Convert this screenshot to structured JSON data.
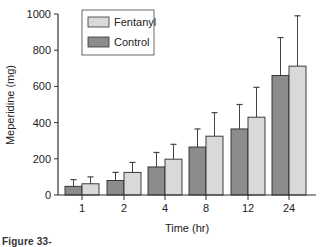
{
  "chart_data": {
    "type": "bar",
    "title": "",
    "xlabel": "Time (hr)",
    "ylabel": "Meperidine (mg)",
    "ylim": [
      0,
      1000
    ],
    "yticks": [
      0,
      200,
      400,
      600,
      800,
      1000
    ],
    "categories": [
      "1",
      "2",
      "4",
      "8",
      "12",
      "24"
    ],
    "grid": false,
    "legend_position": "upper-left",
    "error_bars": true,
    "series": [
      {
        "name": "Control",
        "color": "#8c8c8c",
        "values": [
          48,
          80,
          155,
          265,
          365,
          660
        ],
        "error_upper": [
          85,
          125,
          235,
          365,
          500,
          870
        ]
      },
      {
        "name": "Fentanyl",
        "color": "#d9d9d9",
        "values": [
          62,
          125,
          198,
          325,
          430,
          712
        ],
        "error_upper": [
          100,
          180,
          280,
          455,
          595,
          990
        ]
      }
    ],
    "legend": [
      {
        "label": "Fentanyl",
        "color": "#d9d9d9"
      },
      {
        "label": "Control",
        "color": "#8c8c8c"
      }
    ]
  },
  "caption": {
    "text": "Figure 33-"
  },
  "colors": {
    "axis": "#333333",
    "bar_stroke": "#2a2a2a"
  }
}
